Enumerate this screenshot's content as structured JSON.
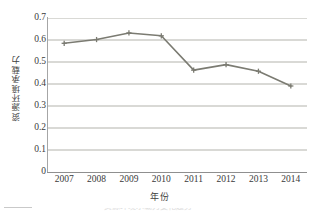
{
  "chart_data": {
    "type": "line",
    "title": "",
    "xlabel": "年份",
    "ylabel": "资源环境承载力",
    "categories": [
      "2007",
      "2008",
      "2009",
      "2010",
      "2011",
      "2012",
      "2013",
      "2014"
    ],
    "values": [
      0.585,
      0.602,
      0.632,
      0.619,
      0.463,
      0.488,
      0.458,
      0.391
    ],
    "series": [
      {
        "name": "资源环境承载力",
        "values": [
          0.585,
          0.602,
          0.632,
          0.619,
          0.463,
          0.488,
          0.458,
          0.391
        ]
      }
    ],
    "ylim": [
      0,
      0.7
    ],
    "y_ticks": [
      "0",
      "0.1",
      "0.2",
      "0.3",
      "0.4",
      "0.5",
      "0.6",
      "0.7"
    ],
    "y_tick_values": [
      0,
      0.1,
      0.2,
      0.3,
      0.4,
      0.5,
      0.6,
      0.7
    ],
    "grid": "horizontal",
    "legend": "none",
    "marker": "cross",
    "line_color": "#7b7b72",
    "grid_color": "#b3b3ac",
    "axis_color": "#8f8f8f",
    "text_color": "#3a3a3a"
  },
  "figure": {
    "background": "#ffffff",
    "clipped_caption": "资源环境承载力变化趋势"
  }
}
